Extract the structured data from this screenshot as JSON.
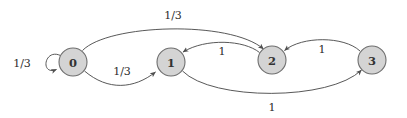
{
  "diagram": {
    "type": "state-transition-graph",
    "background_color": "#ffffff",
    "node_fill_color": "#d4d4d4",
    "node_stroke_color": "#6e6e6e",
    "edge_color": "#4f4f4f",
    "label_color": "#2b2b2b",
    "nodes": [
      {
        "id": "0",
        "label": "0",
        "cx": 73,
        "cy": 62,
        "r": 14
      },
      {
        "id": "1",
        "label": "1",
        "cx": 171,
        "cy": 62,
        "r": 14
      },
      {
        "id": "2",
        "label": "2",
        "cx": 272,
        "cy": 60,
        "r": 14
      },
      {
        "id": "3",
        "label": "3",
        "cx": 372,
        "cy": 60,
        "r": 14
      }
    ],
    "edges": [
      {
        "id": "e-0-0",
        "from": "0",
        "to": "0",
        "label": "1/3",
        "label_x": 22,
        "label_y": 63,
        "kind": "self-loop"
      },
      {
        "id": "e-0-1",
        "from": "0",
        "to": "1",
        "label": "1/3",
        "label_x": 122,
        "label_y": 71,
        "kind": "arc-below"
      },
      {
        "id": "e-0-2",
        "from": "0",
        "to": "2",
        "label": "1/3",
        "label_x": 173,
        "label_y": 15,
        "kind": "arc-above"
      },
      {
        "id": "e-2-1",
        "from": "2",
        "to": "1",
        "label": "1",
        "label_x": 222,
        "label_y": 51,
        "kind": "arc-above"
      },
      {
        "id": "e-3-2",
        "from": "3",
        "to": "2",
        "label": "1",
        "label_x": 322,
        "label_y": 49,
        "kind": "arc-above"
      },
      {
        "id": "e-1-3",
        "from": "1",
        "to": "3",
        "label": "1",
        "label_x": 272,
        "label_y": 107,
        "kind": "arc-below"
      }
    ]
  }
}
